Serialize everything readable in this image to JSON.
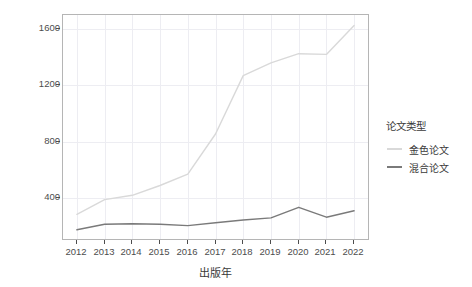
{
  "chart_data": {
    "type": "line",
    "title": "",
    "xlabel": "出版年",
    "ylabel": "APC费用（万元）",
    "x": [
      2012,
      2013,
      2014,
      2015,
      2016,
      2017,
      2018,
      2019,
      2020,
      2021,
      2022
    ],
    "xtick_labels": [
      "2012",
      "2013",
      "2014",
      "2015",
      "2016",
      "2017",
      "2018",
      "2019",
      "2020",
      "2021",
      "2022"
    ],
    "ytick_labels": [
      "400",
      "800",
      "1200",
      "1600"
    ],
    "ytick_values": [
      400,
      800,
      1200,
      1600
    ],
    "ylim": [
      110,
      1700
    ],
    "xlim": [
      2011.5,
      2022.5
    ],
    "grid": true,
    "legend_position": "right",
    "legend_title": "论文类型",
    "series": [
      {
        "name": "金色论文",
        "color": "#d9d9d9",
        "values": [
          285,
          390,
          420,
          490,
          570,
          855,
          1270,
          1360,
          1425,
          1420,
          1625
        ]
      },
      {
        "name": "混合论文",
        "color": "#7a7a7a",
        "values": [
          175,
          215,
          218,
          215,
          205,
          225,
          245,
          260,
          335,
          265,
          310
        ]
      }
    ]
  },
  "axes": {
    "y_title": "APC费用（万元）",
    "x_title": "出版年"
  },
  "legend": {
    "title": "论文类型",
    "items": [
      {
        "label": "金色论文",
        "color": "#d9d9d9"
      },
      {
        "label": "混合论文",
        "color": "#7a7a7a"
      }
    ]
  },
  "colors": {
    "panel_border": "#b5b5b5",
    "gridline": "#ededf2",
    "axis_text": "#4d4d4d",
    "title_text": "#3a3a3a",
    "background": "#ffffff"
  }
}
